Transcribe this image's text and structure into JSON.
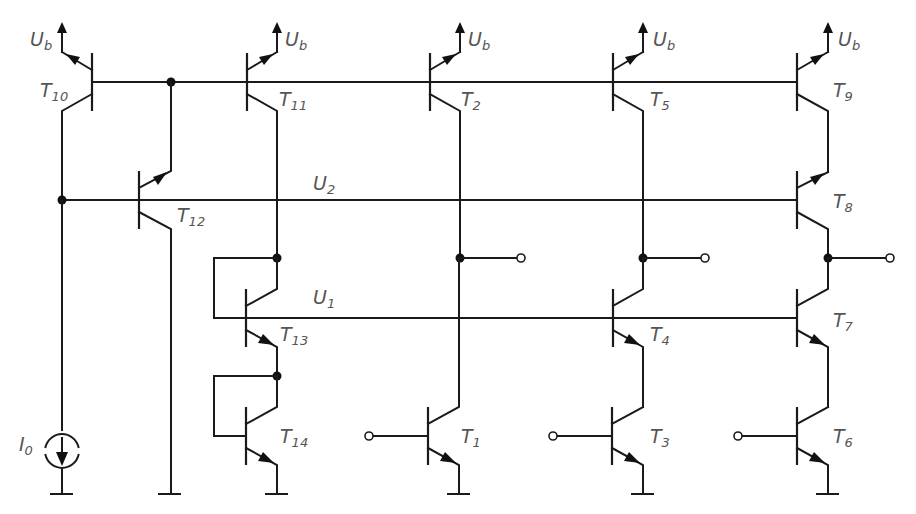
{
  "diagram": {
    "type": "circuit-schematic",
    "supply_label": "U",
    "supply_sub": "b",
    "current_source": {
      "label": "I",
      "sub": "0"
    },
    "rails": [
      {
        "id": "U2",
        "label": "U",
        "sub": "2"
      },
      {
        "id": "U1",
        "label": "U",
        "sub": "1"
      }
    ],
    "transistors": [
      {
        "id": "T10",
        "label": "T",
        "sub": "10",
        "type": "pnp"
      },
      {
        "id": "T11",
        "label": "T",
        "sub": "11",
        "type": "pnp"
      },
      {
        "id": "T2",
        "label": "T",
        "sub": "2",
        "type": "pnp"
      },
      {
        "id": "T5",
        "label": "T",
        "sub": "5",
        "type": "pnp"
      },
      {
        "id": "T9",
        "label": "T",
        "sub": "9",
        "type": "pnp"
      },
      {
        "id": "T12",
        "label": "T",
        "sub": "12",
        "type": "pnp"
      },
      {
        "id": "T8",
        "label": "T",
        "sub": "8",
        "type": "pnp"
      },
      {
        "id": "T13",
        "label": "T",
        "sub": "13",
        "type": "npn"
      },
      {
        "id": "T4",
        "label": "T",
        "sub": "4",
        "type": "npn"
      },
      {
        "id": "T7",
        "label": "T",
        "sub": "7",
        "type": "npn"
      },
      {
        "id": "T14",
        "label": "T",
        "sub": "14",
        "type": "npn"
      },
      {
        "id": "T1",
        "label": "T",
        "sub": "1",
        "type": "npn"
      },
      {
        "id": "T3",
        "label": "T",
        "sub": "3",
        "type": "npn"
      },
      {
        "id": "T6",
        "label": "T",
        "sub": "6",
        "type": "npn"
      }
    ]
  }
}
